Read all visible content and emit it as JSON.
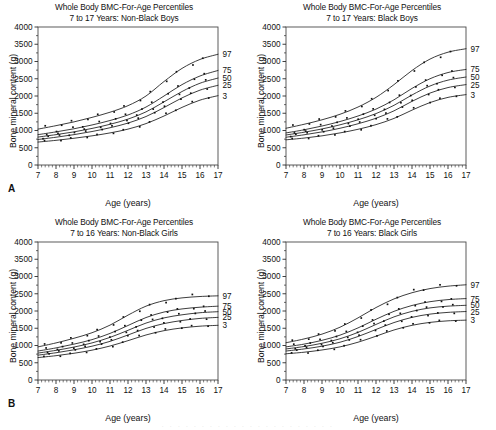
{
  "figure": {
    "panel_letters": [
      "A",
      "B"
    ],
    "shared_title": "Whole Body BMC-For-Age Percentiles",
    "xlabel": "Age (years)",
    "ylabel": "Bone mineral content (g)",
    "percentile_labels": [
      "97",
      "75",
      "50",
      "25",
      "3"
    ],
    "ghost_caption": ". . .  . .  . . .   . .   . .  . . .  . .  . . .   . ."
  },
  "chart_data": [
    {
      "type": "line",
      "panel": "A",
      "title": "Whole Body BMC-For-Age Percentiles",
      "subtitle": "7 to 17 Years: Non-Black Boys",
      "xlabel": "Age (years)",
      "ylabel": "Bone mineral content (g)",
      "xlim": [
        7,
        17
      ],
      "ylim": [
        0,
        4000
      ],
      "xticks": [
        7,
        8,
        9,
        10,
        11,
        12,
        13,
        14,
        15,
        16,
        17
      ],
      "yticks": [
        0,
        500,
        1000,
        1500,
        2000,
        2500,
        3000,
        3500,
        4000
      ],
      "grid": false,
      "legend_position": "right-edge-curve-labels",
      "x": [
        7,
        8,
        9,
        10,
        11,
        12,
        13,
        14,
        15,
        16,
        17
      ],
      "series": [
        {
          "name": "97",
          "values": [
            1040,
            1140,
            1250,
            1380,
            1530,
            1720,
            2000,
            2420,
            2800,
            3060,
            3210
          ]
        },
        {
          "name": "75",
          "values": [
            880,
            960,
            1050,
            1160,
            1290,
            1450,
            1680,
            2000,
            2330,
            2580,
            2740
          ]
        },
        {
          "name": "50",
          "values": [
            810,
            880,
            960,
            1060,
            1180,
            1330,
            1540,
            1830,
            2130,
            2370,
            2520
          ]
        },
        {
          "name": "25",
          "values": [
            740,
            805,
            880,
            970,
            1080,
            1215,
            1405,
            1665,
            1945,
            2170,
            2310
          ]
        },
        {
          "name": "3",
          "values": [
            665,
            715,
            775,
            845,
            930,
            1040,
            1200,
            1420,
            1670,
            1880,
            2010
          ]
        }
      ],
      "scatter_note": "individual subject data points plotted as small filled squares along each percentile curve"
    },
    {
      "type": "line",
      "panel": "A-right",
      "title": "Whole Body BMC-For-Age Percentiles",
      "subtitle": "7 to 17 Years: Black Boys",
      "xlabel": "Age (years)",
      "ylabel": "Bone mineral content (g)",
      "xlim": [
        7,
        17
      ],
      "ylim": [
        0,
        4000
      ],
      "xticks": [
        7,
        8,
        9,
        10,
        11,
        12,
        13,
        14,
        15,
        16,
        17
      ],
      "yticks": [
        0,
        500,
        1000,
        1500,
        2000,
        2500,
        3000,
        3500,
        4000
      ],
      "grid": false,
      "legend_position": "right-edge-curve-labels",
      "x": [
        7,
        8,
        9,
        10,
        11,
        12,
        13,
        14,
        15,
        16,
        17
      ],
      "series": [
        {
          "name": "97",
          "values": [
            1065,
            1180,
            1310,
            1470,
            1680,
            1960,
            2330,
            2740,
            3070,
            3270,
            3370
          ]
        },
        {
          "name": "75",
          "values": [
            930,
            1020,
            1130,
            1260,
            1420,
            1620,
            1890,
            2220,
            2500,
            2680,
            2770
          ]
        },
        {
          "name": "50",
          "values": [
            870,
            950,
            1045,
            1165,
            1310,
            1490,
            1730,
            2030,
            2290,
            2460,
            2550
          ]
        },
        {
          "name": "25",
          "values": [
            805,
            875,
            960,
            1065,
            1195,
            1355,
            1570,
            1845,
            2085,
            2245,
            2330
          ]
        },
        {
          "name": "3",
          "values": [
            730,
            780,
            845,
            930,
            1035,
            1170,
            1350,
            1590,
            1810,
            1960,
            2040
          ]
        }
      ],
      "scatter_note": "individual subject data points plotted as small filled squares along each percentile curve"
    },
    {
      "type": "line",
      "panel": "B",
      "title": "Whole Body BMC-For-Age Percentiles",
      "subtitle": "7 to 16 Years: Non-Black Girls",
      "xlabel": "Age (years)",
      "ylabel": "Bone mineral content (g)",
      "xlim": [
        7,
        17
      ],
      "ylim": [
        0,
        4000
      ],
      "xticks": [
        7,
        8,
        9,
        10,
        11,
        12,
        13,
        14,
        15,
        16,
        17
      ],
      "yticks": [
        0,
        500,
        1000,
        1500,
        2000,
        2500,
        3000,
        3500,
        4000
      ],
      "grid": false,
      "legend_position": "right-edge-curve-labels",
      "x": [
        7,
        8,
        9,
        10,
        11,
        12,
        13,
        14,
        15,
        16,
        17
      ],
      "series": [
        {
          "name": "97",
          "values": [
            960,
            1075,
            1210,
            1370,
            1590,
            1880,
            2140,
            2300,
            2380,
            2420,
            2440
          ]
        },
        {
          "name": "75",
          "values": [
            840,
            930,
            1040,
            1170,
            1350,
            1580,
            1810,
            1970,
            2060,
            2110,
            2140
          ]
        },
        {
          "name": "50",
          "values": [
            780,
            860,
            955,
            1075,
            1235,
            1440,
            1650,
            1800,
            1890,
            1950,
            1980
          ]
        },
        {
          "name": "25",
          "values": [
            720,
            790,
            875,
            980,
            1120,
            1305,
            1495,
            1635,
            1725,
            1785,
            1815
          ]
        },
        {
          "name": "3",
          "values": [
            650,
            705,
            775,
            865,
            985,
            1140,
            1305,
            1430,
            1510,
            1560,
            1585
          ]
        }
      ],
      "scatter_note": "individual subject data points plotted as small filled squares along each percentile curve"
    },
    {
      "type": "line",
      "panel": "B-right",
      "title": "Whole Body BMC-For-Age Percentiles",
      "subtitle": "7 to 16 Years: Black Girls",
      "xlabel": "Age (years)",
      "ylabel": "Bone mineral content (g)",
      "xlim": [
        7,
        17
      ],
      "ylim": [
        0,
        4000
      ],
      "xticks": [
        7,
        8,
        9,
        10,
        11,
        12,
        13,
        14,
        15,
        16,
        17
      ],
      "yticks": [
        0,
        500,
        1000,
        1500,
        2000,
        2500,
        3000,
        3500,
        4000
      ],
      "grid": false,
      "legend_position": "right-edge-curve-labels",
      "x": [
        7,
        8,
        9,
        10,
        11,
        12,
        13,
        14,
        15,
        16,
        17
      ],
      "series": [
        {
          "name": "97",
          "values": [
            1080,
            1190,
            1330,
            1530,
            1800,
            2100,
            2350,
            2530,
            2650,
            2720,
            2760
          ]
        },
        {
          "name": "75",
          "values": [
            960,
            1040,
            1150,
            1300,
            1510,
            1760,
            1990,
            2160,
            2270,
            2330,
            2360
          ]
        },
        {
          "name": "50",
          "values": [
            900,
            970,
            1065,
            1195,
            1380,
            1610,
            1830,
            1990,
            2090,
            2140,
            2165
          ]
        },
        {
          "name": "25",
          "values": [
            840,
            900,
            980,
            1095,
            1260,
            1465,
            1665,
            1815,
            1910,
            1960,
            1985
          ]
        },
        {
          "name": "3",
          "values": [
            760,
            805,
            870,
            960,
            1095,
            1270,
            1450,
            1585,
            1670,
            1715,
            1735
          ]
        }
      ],
      "scatter_note": "individual subject data points plotted as small filled squares along each percentile curve"
    }
  ]
}
